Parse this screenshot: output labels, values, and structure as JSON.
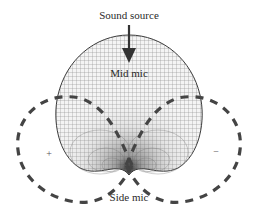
{
  "diagram": {
    "labels": {
      "sound_source": "Sound source",
      "mid_mic": "Mid mic",
      "side_mic": "Side mic",
      "plus": "+",
      "minus": "−"
    },
    "elements": {
      "mid_pattern": "cardioid (mesh-shaded)",
      "side_pattern": "figure-eight (dashed)",
      "arrow": "down-arrow-icon"
    },
    "colors": {
      "mesh": "#6a6a6a",
      "outline": "#3a3a3a",
      "dash": "#444444",
      "text": "#2a2a2a"
    }
  }
}
